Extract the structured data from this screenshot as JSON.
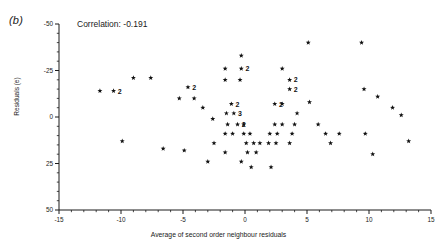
{
  "panel": {
    "label": "(b)"
  },
  "annotation": {
    "correlation_text": "Correlation: -0.191"
  },
  "axes": {
    "xlabel": "Average of second order neighbour residuals",
    "ylabel": "Residuals (e)",
    "x_ticks": [
      "-15",
      "-10",
      "-5",
      "0",
      "5",
      "10",
      "15"
    ],
    "y_ticks": [
      "50",
      "25",
      "0",
      "-25",
      "-50"
    ]
  },
  "colors": {
    "ink": "#1a1a1a",
    "marker": "#111111",
    "background": "#ffffff"
  },
  "chart_data": {
    "type": "scatter",
    "title": "",
    "subtitle": "(b)",
    "xlabel": "Average of second order neighbour residuals",
    "ylabel": "Residuals (e)",
    "xlim": [
      -15,
      15
    ],
    "ylim": [
      -50,
      50
    ],
    "xticks": [
      -15,
      -10,
      -5,
      0,
      5,
      10,
      15
    ],
    "yticks": [
      -50,
      -25,
      0,
      25,
      50
    ],
    "minor_ticks": true,
    "grid": false,
    "legend": null,
    "annotations": [
      {
        "text": "Correlation: -0.191",
        "x": -9.0,
        "y": 45
      }
    ],
    "correlation": -0.191,
    "marker": "star",
    "note": "Integer labels beside a marker give the count of coincident points at that location.",
    "points": [
      {
        "x": -11.7,
        "y": 14,
        "count": 1
      },
      {
        "x": -10.6,
        "y": 14,
        "count": 2
      },
      {
        "x": -9.0,
        "y": 21,
        "count": 1
      },
      {
        "x": -7.6,
        "y": 21,
        "count": 1
      },
      {
        "x": -9.9,
        "y": -13,
        "count": 1
      },
      {
        "x": -6.6,
        "y": -17,
        "count": 1
      },
      {
        "x": -4.6,
        "y": 16,
        "count": 2
      },
      {
        "x": -5.3,
        "y": 10,
        "count": 1
      },
      {
        "x": -4.1,
        "y": 10,
        "count": 1
      },
      {
        "x": -3.4,
        "y": 5,
        "count": 1
      },
      {
        "x": -2.6,
        "y": -1,
        "count": 1
      },
      {
        "x": -4.9,
        "y": -18,
        "count": 1
      },
      {
        "x": -3.0,
        "y": -24,
        "count": 1
      },
      {
        "x": -1.6,
        "y": 26,
        "count": 1
      },
      {
        "x": -0.3,
        "y": 33,
        "count": 1
      },
      {
        "x": -0.3,
        "y": 26,
        "count": 2
      },
      {
        "x": -1.6,
        "y": 20,
        "count": 1
      },
      {
        "x": -0.4,
        "y": 20,
        "count": 1
      },
      {
        "x": -1.1,
        "y": 7,
        "count": 2
      },
      {
        "x": -1.5,
        "y": 2,
        "count": 1
      },
      {
        "x": -0.9,
        "y": 2,
        "count": 3
      },
      {
        "x": -1.4,
        "y": -4,
        "count": 1
      },
      {
        "x": -0.6,
        "y": -4,
        "count": 2
      },
      {
        "x": -0.1,
        "y": -4,
        "count": 1
      },
      {
        "x": -1.6,
        "y": -9,
        "count": 1
      },
      {
        "x": -1.0,
        "y": -9,
        "count": 1
      },
      {
        "x": -0.1,
        "y": -9,
        "count": 1
      },
      {
        "x": 0.4,
        "y": -9,
        "count": 1
      },
      {
        "x": -2.5,
        "y": -14,
        "count": 1
      },
      {
        "x": 0.1,
        "y": -14,
        "count": 1
      },
      {
        "x": 0.7,
        "y": -14,
        "count": 1
      },
      {
        "x": 1.2,
        "y": -14,
        "count": 1
      },
      {
        "x": -1.6,
        "y": -19,
        "count": 1
      },
      {
        "x": 0.2,
        "y": -19,
        "count": 1
      },
      {
        "x": 0.9,
        "y": -19,
        "count": 1
      },
      {
        "x": -0.3,
        "y": -24,
        "count": 1
      },
      {
        "x": 0.5,
        "y": -27,
        "count": 1
      },
      {
        "x": 2.1,
        "y": -27,
        "count": 1
      },
      {
        "x": 3.0,
        "y": 26,
        "count": 1
      },
      {
        "x": 3.6,
        "y": 20,
        "count": 2
      },
      {
        "x": 3.6,
        "y": 15,
        "count": 2
      },
      {
        "x": 2.4,
        "y": 7,
        "count": 2
      },
      {
        "x": 3.0,
        "y": 7,
        "count": 1
      },
      {
        "x": 4.2,
        "y": 2,
        "count": 1
      },
      {
        "x": 2.4,
        "y": -4,
        "count": 1
      },
      {
        "x": 3.0,
        "y": -4,
        "count": 1
      },
      {
        "x": 4.0,
        "y": -4,
        "count": 1
      },
      {
        "x": 2.0,
        "y": -9,
        "count": 1
      },
      {
        "x": 2.6,
        "y": -9,
        "count": 1
      },
      {
        "x": 3.8,
        "y": -9,
        "count": 1
      },
      {
        "x": 1.9,
        "y": -14,
        "count": 1
      },
      {
        "x": 2.5,
        "y": -14,
        "count": 1
      },
      {
        "x": 3.6,
        "y": -14,
        "count": 1
      },
      {
        "x": 5.1,
        "y": 40,
        "count": 1
      },
      {
        "x": 5.2,
        "y": 8,
        "count": 1
      },
      {
        "x": 5.9,
        "y": -4,
        "count": 1
      },
      {
        "x": 6.5,
        "y": -9,
        "count": 1
      },
      {
        "x": 6.9,
        "y": -14,
        "count": 1
      },
      {
        "x": 7.6,
        "y": -9,
        "count": 1
      },
      {
        "x": 9.4,
        "y": 40,
        "count": 1
      },
      {
        "x": 9.6,
        "y": 15,
        "count": 1
      },
      {
        "x": 9.7,
        "y": -9,
        "count": 1
      },
      {
        "x": 10.7,
        "y": 11,
        "count": 1
      },
      {
        "x": 10.3,
        "y": -20,
        "count": 1
      },
      {
        "x": 11.9,
        "y": 5,
        "count": 1
      },
      {
        "x": 12.6,
        "y": 1,
        "count": 1
      },
      {
        "x": 13.2,
        "y": -13,
        "count": 1
      }
    ]
  }
}
